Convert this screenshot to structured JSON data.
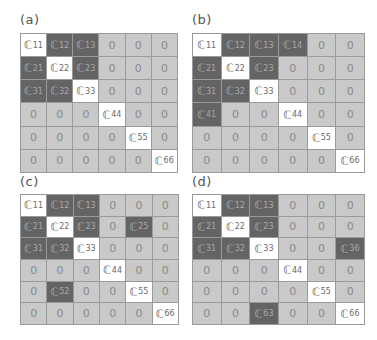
{
  "colors": {
    "zero_cell": "#c9c9c9",
    "coupled_cell": "#646464",
    "diagonal_cell": "#ffffff",
    "border": "#9a9a9a"
  },
  "symbol": "ℂ",
  "panels": [
    {
      "label": "(a)",
      "cells": [
        [
          "C11",
          "C12",
          "C13",
          "0",
          "0",
          "0"
        ],
        [
          "C21",
          "C22",
          "C23",
          "0",
          "0",
          "0"
        ],
        [
          "C31",
          "C32",
          "C33",
          "0",
          "0",
          "0"
        ],
        [
          "0",
          "0",
          "0",
          "C44",
          "0",
          "0"
        ],
        [
          "0",
          "0",
          "0",
          "0",
          "C55",
          "0"
        ],
        [
          "0",
          "0",
          "0",
          "0",
          "0",
          "C66"
        ]
      ]
    },
    {
      "label": "(b)",
      "cells": [
        [
          "C11",
          "C12",
          "C13",
          "C14",
          "0",
          "0"
        ],
        [
          "C21",
          "C22",
          "C23",
          "0",
          "0",
          "0"
        ],
        [
          "C31",
          "C32",
          "C33",
          "0",
          "0",
          "0"
        ],
        [
          "C41",
          "0",
          "0",
          "C44",
          "0",
          "0"
        ],
        [
          "0",
          "0",
          "0",
          "0",
          "C55",
          "0"
        ],
        [
          "0",
          "0",
          "0",
          "0",
          "0",
          "C66"
        ]
      ]
    },
    {
      "label": "(c)",
      "cells": [
        [
          "C11",
          "C12",
          "C13",
          "0",
          "0",
          "0"
        ],
        [
          "C21",
          "C22",
          "C23",
          "0",
          "C25",
          "0"
        ],
        [
          "C31",
          "C32",
          "C33",
          "0",
          "0",
          "0"
        ],
        [
          "0",
          "0",
          "0",
          "C44",
          "0",
          "0"
        ],
        [
          "0",
          "C52",
          "0",
          "0",
          "C55",
          "0"
        ],
        [
          "0",
          "0",
          "0",
          "0",
          "0",
          "C66"
        ]
      ]
    },
    {
      "label": "(d)",
      "cells": [
        [
          "C11",
          "C12",
          "C13",
          "0",
          "0",
          "0"
        ],
        [
          "C21",
          "C22",
          "C23",
          "0",
          "0",
          "0"
        ],
        [
          "C31",
          "C32",
          "C33",
          "0",
          "0",
          "C36"
        ],
        [
          "0",
          "0",
          "0",
          "C44",
          "0",
          "0"
        ],
        [
          "0",
          "0",
          "0",
          "0",
          "C55",
          "0"
        ],
        [
          "0",
          "0",
          "C63",
          "0",
          "0",
          "C66"
        ]
      ]
    }
  ]
}
